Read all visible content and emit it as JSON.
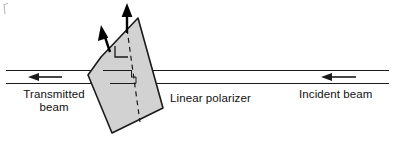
{
  "figure": {
    "background_color": "#ffffff",
    "line_color": "#1a1a1a",
    "polarizer_fill": "#d2d2d2",
    "polarizer_stroke": "#1a1a1a",
    "arrow_color": "#000000"
  },
  "labels": {
    "transmitted_line1": "Transmitted",
    "transmitted_line2": "beam",
    "incident": "Incident beam",
    "polarizer": "Linear polarizer"
  },
  "elements": {
    "incident_beam_arrow": "arrow-left-icon",
    "transmitted_beam_arrow": "arrow-left-icon",
    "polarization_arrow_vertical": "polarization-vector-arrow-icon",
    "polarization_arrow_tilted": "polarization-vector-arrow-icon",
    "transmission_axis": "dashed-axis-line",
    "right_angle_mark": "right-angle-marker"
  }
}
